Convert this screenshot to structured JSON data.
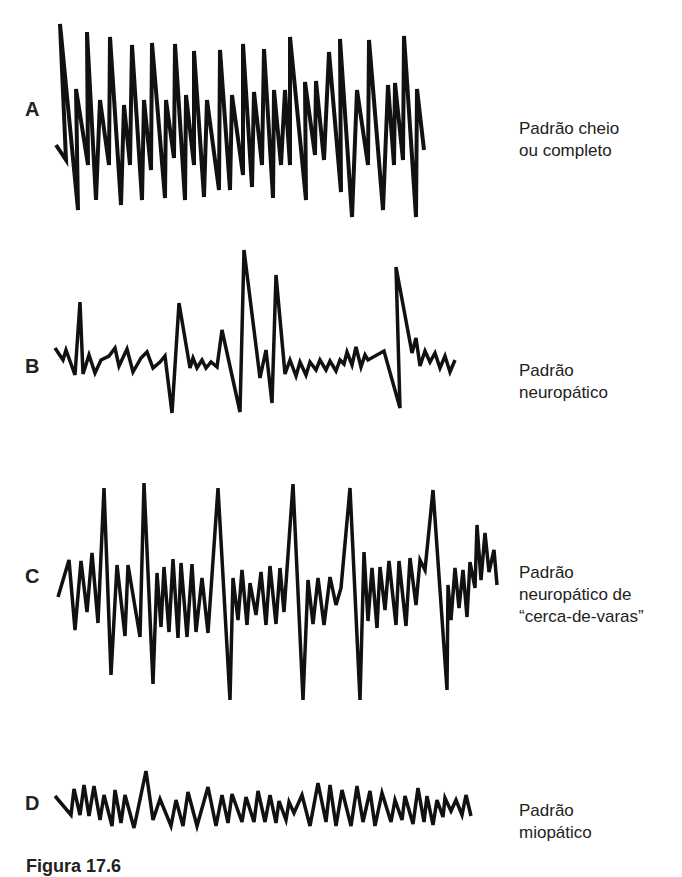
{
  "figure": {
    "caption": "Figura 17.6",
    "stroke_color": "#111111",
    "panels": [
      {
        "letter": "A",
        "label": "Padrão cheio\nou completo"
      },
      {
        "letter": "B",
        "label": "Padrão\nneuropático"
      },
      {
        "letter": "C",
        "label": "Padrão\nneuropático de\n“cerca-de-varas”"
      },
      {
        "letter": "D",
        "label": "Padrão\nmiopático"
      }
    ]
  }
}
